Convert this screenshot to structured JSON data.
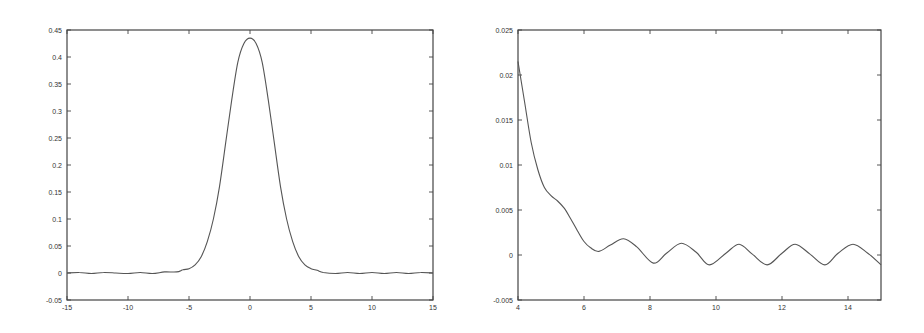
{
  "chart_data": [
    {
      "type": "line",
      "title": "",
      "xlabel": "",
      "ylabel": "",
      "xlim": [
        -15,
        15
      ],
      "ylim": [
        -0.05,
        0.45
      ],
      "grid": false,
      "legend": null,
      "xticks": [
        "-15",
        "-10",
        "-5",
        "0",
        "5",
        "10",
        "15"
      ],
      "yticks": [
        "-0.05",
        "0",
        "0.05",
        "0.1",
        "0.15",
        "0.2",
        "0.25",
        "0.3",
        "0.35",
        "0.4",
        "0.45"
      ],
      "series": [
        {
          "name": "curve",
          "x": [
            -15,
            -14,
            -13,
            -12,
            -11,
            -10,
            -9,
            -8,
            -7,
            -6,
            -5.5,
            -5,
            -4.5,
            -4,
            -3.5,
            -3,
            -2.5,
            -2,
            -1.5,
            -1,
            -0.5,
            0,
            0.5,
            1,
            1.5,
            2,
            2.5,
            3,
            3.5,
            4,
            4.5,
            5,
            5.5,
            6,
            7,
            8,
            9,
            10,
            11,
            12,
            13,
            14,
            15
          ],
          "y": [
            0,
            0.001,
            -0.001,
            0.001,
            0,
            -0.001,
            0.001,
            -0.001,
            0.002,
            0.002,
            0.006,
            0.008,
            0.015,
            0.03,
            0.058,
            0.1,
            0.16,
            0.24,
            0.32,
            0.39,
            0.425,
            0.435,
            0.425,
            0.39,
            0.32,
            0.24,
            0.16,
            0.1,
            0.058,
            0.03,
            0.015,
            0.008,
            0.005,
            0.001,
            -0.001,
            0.001,
            -0.001,
            0.001,
            -0.001,
            0.001,
            -0.001,
            0.001,
            0
          ]
        }
      ]
    },
    {
      "type": "line",
      "title": "",
      "xlabel": "",
      "ylabel": "",
      "xlim": [
        4,
        15
      ],
      "ylim": [
        -0.005,
        0.025
      ],
      "grid": false,
      "legend": null,
      "xticks": [
        "4",
        "6",
        "8",
        "10",
        "12",
        "14"
      ],
      "yticks": [
        "-0.005",
        "0",
        "0.005",
        "0.01",
        "0.015",
        "0.02",
        "0.025"
      ],
      "series": [
        {
          "name": "curve",
          "x": [
            4,
            4.2,
            4.4,
            4.6,
            4.8,
            5.0,
            5.2,
            5.4,
            5.6,
            5.8,
            6.0,
            6.2,
            6.45,
            6.8,
            7.2,
            7.6,
            8.1,
            8.5,
            8.95,
            9.4,
            9.8,
            10.3,
            10.7,
            11.1,
            11.55,
            12.0,
            12.4,
            12.85,
            13.3,
            13.7,
            14.15,
            14.6,
            15
          ],
          "y": [
            0.0215,
            0.017,
            0.0125,
            0.0095,
            0.0075,
            0.0066,
            0.006,
            0.0052,
            0.004,
            0.0027,
            0.0015,
            0.0008,
            0.0004,
            0.0011,
            0.0018,
            0.0009,
            -0.0009,
            0.0002,
            0.0013,
            0.0003,
            -0.0011,
            0.0002,
            0.0012,
            0.0001,
            -0.0011,
            0.0002,
            0.0012,
            0.0001,
            -0.0011,
            0.0002,
            0.0012,
            0.0002,
            -0.0011
          ]
        }
      ]
    }
  ]
}
